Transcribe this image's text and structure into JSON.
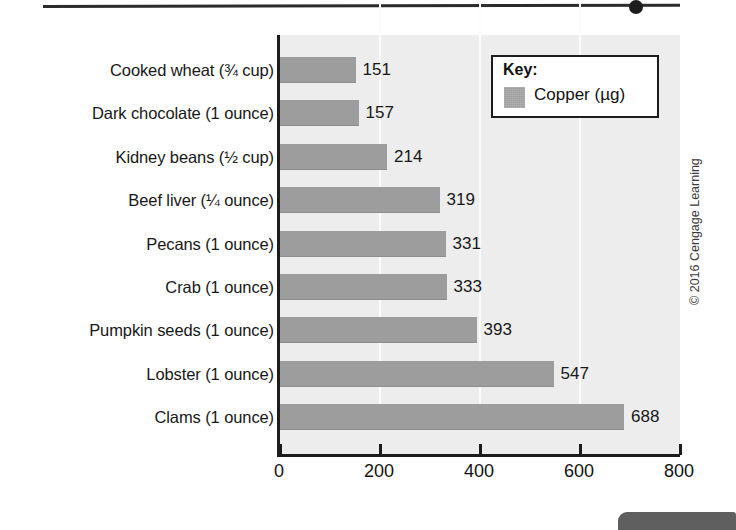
{
  "decor": {
    "top_rule": "horizontal-rule",
    "top_rule_dot": "bullet-dot",
    "corner_tab": "page-corner-tab"
  },
  "credit": "© 2016 Cengage Learning",
  "legend": {
    "title": "Key:",
    "series_label": "Copper (µg)",
    "swatch_color": "#9d9d9d"
  },
  "axis": {
    "x_ticks": [
      "0",
      "200",
      "400",
      "600",
      "800"
    ],
    "x_min": 0,
    "x_max": 800
  },
  "chart_data": {
    "type": "bar",
    "orientation": "horizontal",
    "title": "",
    "subtitle": "",
    "xlabel": "",
    "ylabel": "",
    "xlim": [
      0,
      800
    ],
    "grid": true,
    "gridlines_at": [
      200,
      400,
      600
    ],
    "legend_position": "top-right",
    "series": [
      {
        "name": "Copper (µg)",
        "color": "#9d9d9d",
        "values": [
          151,
          157,
          214,
          319,
          331,
          333,
          393,
          547,
          688
        ]
      }
    ],
    "categories": [
      "Cooked wheat (¾ cup)",
      "Dark chocolate (1 ounce)",
      "Kidney beans (½ cup)",
      "Beef liver (¼ ounce)",
      "Pecans (1 ounce)",
      "Crab (1 ounce)",
      "Pumpkin seeds (1 ounce)",
      "Lobster (1 ounce)",
      "Clams (1 ounce)"
    ],
    "data_labels": [
      "151",
      "157",
      "214",
      "319",
      "331",
      "333",
      "393",
      "547",
      "688"
    ],
    "bars": [
      {
        "category": "Cooked wheat (¾ cup)",
        "value": 151,
        "label": "151"
      },
      {
        "category": "Dark chocolate (1 ounce)",
        "value": 157,
        "label": "157"
      },
      {
        "category": "Kidney beans (½ cup)",
        "value": 214,
        "label": "214"
      },
      {
        "category": "Beef liver (¼ ounce)",
        "value": 319,
        "label": "319"
      },
      {
        "category": "Pecans (1 ounce)",
        "value": 331,
        "label": "331"
      },
      {
        "category": "Crab (1 ounce)",
        "value": 333,
        "label": "333"
      },
      {
        "category": "Pumpkin seeds (1 ounce)",
        "value": 393,
        "label": "393"
      },
      {
        "category": "Lobster (1 ounce)",
        "value": 547,
        "label": "547"
      },
      {
        "category": "Clams (1 ounce)",
        "value": 688,
        "label": "688"
      }
    ]
  }
}
